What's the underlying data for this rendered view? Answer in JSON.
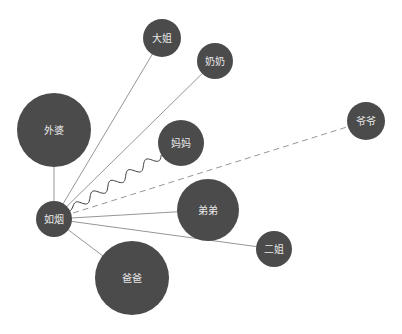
{
  "diagram": {
    "type": "relationship-network",
    "center": "ruyan",
    "colors": {
      "node_fill": "#4b4b4b",
      "edge": "#8a8a8a",
      "label": "#e8e8e8",
      "background": "#ffffff"
    },
    "nodes": [
      {
        "id": "ruyan",
        "label": "如烟",
        "x": 54,
        "y": 219,
        "r": 18
      },
      {
        "id": "waipo",
        "label": "外婆",
        "x": 54,
        "y": 130,
        "r": 37
      },
      {
        "id": "dajie",
        "label": "大姐",
        "x": 162,
        "y": 38,
        "r": 19
      },
      {
        "id": "nainai",
        "label": "奶奶",
        "x": 215,
        "y": 61,
        "r": 18
      },
      {
        "id": "mama",
        "label": "妈妈",
        "x": 181,
        "y": 143,
        "r": 23
      },
      {
        "id": "yeye",
        "label": "爷爷",
        "x": 366,
        "y": 121,
        "r": 19
      },
      {
        "id": "didi",
        "label": "弟弟",
        "x": 208,
        "y": 210,
        "r": 31
      },
      {
        "id": "erjie",
        "label": "二姐",
        "x": 274,
        "y": 249,
        "r": 18
      },
      {
        "id": "baba",
        "label": "爸爸",
        "x": 132,
        "y": 278,
        "r": 37
      }
    ],
    "edges": [
      {
        "from": "ruyan",
        "to": "waipo",
        "style": "solid"
      },
      {
        "from": "ruyan",
        "to": "dajie",
        "style": "solid"
      },
      {
        "from": "ruyan",
        "to": "nainai",
        "style": "solid"
      },
      {
        "from": "ruyan",
        "to": "mama",
        "style": "wavy"
      },
      {
        "from": "ruyan",
        "to": "yeye",
        "style": "dashed"
      },
      {
        "from": "ruyan",
        "to": "didi",
        "style": "solid"
      },
      {
        "from": "ruyan",
        "to": "erjie",
        "style": "solid"
      },
      {
        "from": "ruyan",
        "to": "baba",
        "style": "solid"
      }
    ]
  }
}
